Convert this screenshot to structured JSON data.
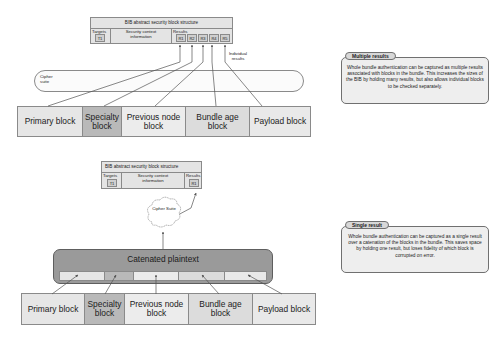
{
  "top_diagram": {
    "bib_structure": {
      "title": "BIB abstract security block structure",
      "targets_label": "Targets",
      "targets": [
        "T1"
      ],
      "context_label": "Security context information",
      "results_label": "Results",
      "results": [
        "R1",
        "R2",
        "R3",
        "R4",
        "R5"
      ]
    },
    "individual_results_note": "Individual results",
    "cipher_label": "Cipher suite",
    "blocks": [
      {
        "label": "Primary block",
        "color": "#e6e6e6"
      },
      {
        "label": "Specialty block",
        "color": "#b9b9b9"
      },
      {
        "label": "Previous node block",
        "color": "#ececec"
      },
      {
        "label": "Bundle age block",
        "color": "#dcdcdc"
      },
      {
        "label": "Payload block",
        "color": "#e9e9e9"
      }
    ]
  },
  "bottom_diagram": {
    "bib_structure": {
      "title": "BIB abstract security block structure",
      "targets_label": "Targets",
      "targets": [
        "T1"
      ],
      "context_label": "Security context information",
      "results_label": "Results",
      "results": [
        "R1"
      ]
    },
    "cipher_label": "Cipher Suite",
    "catenated_label": "Catenated plaintext",
    "blocks": [
      {
        "label": "Primary block",
        "color": "#e6e6e6"
      },
      {
        "label": "Specialty block",
        "color": "#b9b9b9"
      },
      {
        "label": "Previous node block",
        "color": "#ececec"
      },
      {
        "label": "Bundle age block",
        "color": "#dcdcdc"
      },
      {
        "label": "Payload block",
        "color": "#e9e9e9"
      }
    ]
  },
  "callouts": {
    "multiple": {
      "title": "Multiple results",
      "body": "Whole bundle authentication can be captured as multiple results associated with blocks in the bundle. This increases the sizes of the BIB by holding many results, but also allows individual blocks to be checked separately."
    },
    "single": {
      "title": "Single result",
      "body": "Whole bundle authentication can be captured as a single result over a catenation of the blocks in the bundle. This saves space by holding one result, but loses fidelity of which block is corrupted on error."
    }
  }
}
